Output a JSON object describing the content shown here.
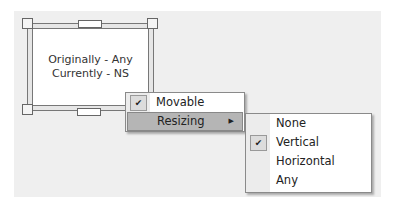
{
  "window": {
    "line1": "Originally - Any",
    "line2": "Currently - NS"
  },
  "context_menu": {
    "items": [
      {
        "label": "Movable",
        "checked": true,
        "icon": "check-icon"
      },
      {
        "label": "Resizing",
        "highlighted": true,
        "submenu_icon": "chevron-right-icon"
      }
    ]
  },
  "resizing_submenu": {
    "items": [
      {
        "label": "None",
        "checked": false
      },
      {
        "label": "Vertical",
        "checked": true,
        "icon": "check-icon"
      },
      {
        "label": "Horizontal",
        "checked": false
      },
      {
        "label": "Any",
        "checked": false
      }
    ]
  },
  "glyphs": {
    "check": "✔",
    "arrow": "▶"
  }
}
